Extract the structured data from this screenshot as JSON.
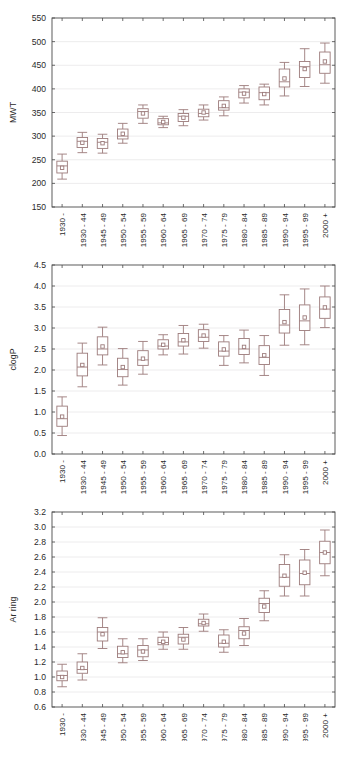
{
  "figure": {
    "width": 347,
    "height": 757,
    "background": "#ffffff",
    "box_color": "#9c7b7b",
    "axis_color": "#4a4a4a",
    "grid_color": "#e9e7e8",
    "xlabel": "Publication Year Bin",
    "categories": [
      "1930 -",
      "1930 - 44",
      "1945 - 49",
      "1950 - 54",
      "1955 - 59",
      "1960 - 64",
      "1965 - 69",
      "1970 - 74",
      "1975 - 79",
      "1980 - 84",
      "1985 - 89",
      "1990 - 94",
      "1995 - 99",
      "2000 +"
    ]
  },
  "chart_data": [
    {
      "type": "box",
      "id": "mwt",
      "title": "",
      "xlabel": "",
      "ylabel": "MWT",
      "ylim": [
        150,
        550
      ],
      "yticks": [
        150,
        200,
        250,
        300,
        350,
        400,
        450,
        500,
        550
      ],
      "ytick_labels": [
        "150",
        "200",
        "250",
        "300",
        "350",
        "400",
        "450",
        "500",
        "550"
      ],
      "grid": true,
      "legend": "none",
      "categories": [
        "1930 -",
        "1930 - 44",
        "1945 - 49",
        "1950 - 54",
        "1955 - 59",
        "1960 - 64",
        "1965 - 69",
        "1970 - 74",
        "1975 - 79",
        "1980 - 84",
        "1985 - 89",
        "1990 - 94",
        "1995 - 99",
        "2000 +"
      ],
      "boxes": [
        {
          "category": "1930 -",
          "whisker_low": 209,
          "q1": 222,
          "median": 237,
          "mean": 233,
          "q3": 247,
          "whisker_high": 262
        },
        {
          "category": "1930 - 44",
          "whisker_low": 265,
          "q1": 276,
          "median": 289,
          "mean": 286,
          "q3": 297,
          "whisker_high": 308
        },
        {
          "category": "1945 - 49",
          "whisker_low": 264,
          "q1": 274,
          "median": 287,
          "mean": 285,
          "q3": 295,
          "whisker_high": 304
        },
        {
          "category": "1950 - 54",
          "whisker_low": 285,
          "q1": 294,
          "median": 300,
          "mean": 305,
          "q3": 315,
          "whisker_high": 327
        },
        {
          "category": "1955 - 59",
          "whisker_low": 327,
          "q1": 338,
          "median": 352,
          "mean": 348,
          "q3": 358,
          "whisker_high": 366
        },
        {
          "category": "1960 - 64",
          "whisker_low": 318,
          "q1": 324,
          "median": 328,
          "mean": 330,
          "q3": 337,
          "whisker_high": 342
        },
        {
          "category": "1965 - 69",
          "whisker_low": 322,
          "q1": 331,
          "median": 342,
          "mean": 339,
          "q3": 348,
          "whisker_high": 356
        },
        {
          "category": "1970 - 74",
          "whisker_low": 334,
          "q1": 341,
          "median": 348,
          "mean": 350,
          "q3": 357,
          "whisker_high": 366
        },
        {
          "category": "1975 - 79",
          "whisker_low": 343,
          "q1": 355,
          "median": 360,
          "mean": 364,
          "q3": 375,
          "whisker_high": 383
        },
        {
          "category": "1980 - 84",
          "whisker_low": 370,
          "q1": 381,
          "median": 393,
          "mean": 390,
          "q3": 400,
          "whisker_high": 407
        },
        {
          "category": "1985 - 89",
          "whisker_low": 366,
          "q1": 377,
          "median": 392,
          "mean": 389,
          "q3": 404,
          "whisker_high": 410
        },
        {
          "category": "1990 - 94",
          "whisker_low": 385,
          "q1": 404,
          "median": 415,
          "mean": 422,
          "q3": 442,
          "whisker_high": 456
        },
        {
          "category": "1995 - 99",
          "whisker_low": 405,
          "q1": 424,
          "median": 447,
          "mean": 442,
          "q3": 458,
          "whisker_high": 485
        },
        {
          "category": "2000 +",
          "whisker_low": 412,
          "q1": 433,
          "median": 451,
          "mean": 458,
          "q3": 478,
          "whisker_high": 497
        }
      ]
    },
    {
      "type": "box",
      "id": "clogp",
      "title": "",
      "xlabel": "",
      "ylabel": "clogP",
      "ylim": [
        0.0,
        4.5
      ],
      "yticks": [
        0.0,
        0.5,
        1.0,
        1.5,
        2.0,
        2.5,
        3.0,
        3.5,
        4.0,
        4.5
      ],
      "ytick_labels": [
        "0.0",
        "0.5",
        "1.0",
        "1.5",
        "2.0",
        "2.5",
        "3.0",
        "3.5",
        "4.0",
        "4.5"
      ],
      "grid": true,
      "legend": "none",
      "categories": [
        "1930 -",
        "1930 - 44",
        "1945 - 49",
        "1950 - 54",
        "1955 - 59",
        "1960 - 64",
        "1965 - 69",
        "1970 - 74",
        "1975 - 79",
        "1980 - 84",
        "1985 - 89",
        "1990 - 94",
        "1995 - 99",
        "2000 +"
      ],
      "boxes": [
        {
          "category": "1930 -",
          "whisker_low": 0.44,
          "q1": 0.66,
          "median": 0.84,
          "mean": 0.89,
          "q3": 1.14,
          "whisker_high": 1.36
        },
        {
          "category": "1930 - 44",
          "whisker_low": 1.6,
          "q1": 1.86,
          "median": 2.07,
          "mean": 2.12,
          "q3": 2.4,
          "whisker_high": 2.64
        },
        {
          "category": "1945 - 49",
          "whisker_low": 2.12,
          "q1": 2.36,
          "median": 2.5,
          "mean": 2.56,
          "q3": 2.79,
          "whisker_high": 3.02
        },
        {
          "category": "1950 - 54",
          "whisker_low": 1.64,
          "q1": 1.84,
          "median": 2.01,
          "mean": 2.07,
          "q3": 2.28,
          "whisker_high": 2.51
        },
        {
          "category": "1955 - 59",
          "whisker_low": 1.9,
          "q1": 2.11,
          "median": 2.24,
          "mean": 2.27,
          "q3": 2.46,
          "whisker_high": 2.68
        },
        {
          "category": "1960 - 64",
          "whisker_low": 2.36,
          "q1": 2.5,
          "median": 2.57,
          "mean": 2.6,
          "q3": 2.72,
          "whisker_high": 2.84
        },
        {
          "category": "1965 - 69",
          "whisker_low": 2.38,
          "q1": 2.57,
          "median": 2.67,
          "mean": 2.71,
          "q3": 2.87,
          "whisker_high": 3.06
        },
        {
          "category": "1970 - 74",
          "whisker_low": 2.52,
          "q1": 2.68,
          "median": 2.78,
          "mean": 2.82,
          "q3": 2.96,
          "whisker_high": 3.09
        },
        {
          "category": "1975 - 79",
          "whisker_low": 2.11,
          "q1": 2.33,
          "median": 2.45,
          "mean": 2.49,
          "q3": 2.67,
          "whisker_high": 2.82
        },
        {
          "category": "1980 - 84",
          "whisker_low": 2.17,
          "q1": 2.37,
          "median": 2.5,
          "mean": 2.55,
          "q3": 2.75,
          "whisker_high": 2.95
        },
        {
          "category": "1985 - 89",
          "whisker_low": 1.87,
          "q1": 2.13,
          "median": 2.3,
          "mean": 2.35,
          "q3": 2.58,
          "whisker_high": 2.82
        },
        {
          "category": "1990 - 94",
          "whisker_low": 2.59,
          "q1": 2.88,
          "median": 3.07,
          "mean": 3.14,
          "q3": 3.44,
          "whisker_high": 3.79
        },
        {
          "category": "1995 - 99",
          "whisker_low": 2.6,
          "q1": 2.94,
          "median": 3.17,
          "mean": 3.25,
          "q3": 3.55,
          "whisker_high": 3.93
        },
        {
          "category": "2000 +",
          "whisker_low": 3.01,
          "q1": 3.23,
          "median": 3.45,
          "mean": 3.49,
          "q3": 3.74,
          "whisker_high": 4.0
        }
      ]
    },
    {
      "type": "box",
      "id": "arring",
      "title": "",
      "xlabel": "Publication Year Bin",
      "ylabel": "Ar ring",
      "ylim": [
        0.6,
        3.2
      ],
      "yticks": [
        0.6,
        0.8,
        1.0,
        1.2,
        1.4,
        1.6,
        1.8,
        2.0,
        2.2,
        2.4,
        2.6,
        2.8,
        3.0,
        3.2
      ],
      "ytick_labels": [
        "0.6",
        "0.8",
        "1.0",
        "1.2",
        "1.4",
        "1.6",
        "1.8",
        "2.0",
        "2.2",
        "2.4",
        "2.6",
        "2.8",
        "3.0",
        "3.2"
      ],
      "grid": true,
      "legend": "none",
      "categories": [
        "1930 -",
        "1930 - 44",
        "1945 - 49",
        "1950 - 54",
        "1955 - 59",
        "1960 - 64",
        "1965 - 69",
        "1970 - 74",
        "1975 - 79",
        "1980 - 84",
        "1985 - 89",
        "1990 - 94",
        "1995 - 99",
        "2000 +"
      ],
      "boxes": [
        {
          "category": "1930 -",
          "whisker_low": 0.87,
          "q1": 0.95,
          "median": 1.02,
          "mean": 1.0,
          "q3": 1.08,
          "whisker_high": 1.17
        },
        {
          "category": "1930 - 44",
          "whisker_low": 0.96,
          "q1": 1.05,
          "median": 1.1,
          "mean": 1.12,
          "q3": 1.2,
          "whisker_high": 1.31
        },
        {
          "category": "1945 - 49",
          "whisker_low": 1.38,
          "q1": 1.48,
          "median": 1.6,
          "mean": 1.57,
          "q3": 1.66,
          "whisker_high": 1.79
        },
        {
          "category": "1950 - 54",
          "whisker_low": 1.19,
          "q1": 1.26,
          "median": 1.31,
          "mean": 1.33,
          "q3": 1.41,
          "whisker_high": 1.51
        },
        {
          "category": "1955 - 59",
          "whisker_low": 1.22,
          "q1": 1.27,
          "median": 1.36,
          "mean": 1.34,
          "q3": 1.42,
          "whisker_high": 1.51
        },
        {
          "category": "1960 - 64",
          "whisker_low": 1.37,
          "q1": 1.43,
          "median": 1.46,
          "mean": 1.47,
          "q3": 1.53,
          "whisker_high": 1.6
        },
        {
          "category": "1965 - 69",
          "whisker_low": 1.37,
          "q1": 1.44,
          "median": 1.53,
          "mean": 1.5,
          "q3": 1.57,
          "whisker_high": 1.66
        },
        {
          "category": "1970 - 74",
          "whisker_low": 1.61,
          "q1": 1.68,
          "median": 1.71,
          "mean": 1.72,
          "q3": 1.77,
          "whisker_high": 1.84
        },
        {
          "category": "1975 - 79",
          "whisker_low": 1.33,
          "q1": 1.4,
          "median": 1.45,
          "mean": 1.47,
          "q3": 1.56,
          "whisker_high": 1.63
        },
        {
          "category": "1980 - 84",
          "whisker_low": 1.42,
          "q1": 1.51,
          "median": 1.62,
          "mean": 1.58,
          "q3": 1.67,
          "whisker_high": 1.78
        },
        {
          "category": "1985 - 89",
          "whisker_low": 1.75,
          "q1": 1.86,
          "median": 1.98,
          "mean": 1.94,
          "q3": 2.05,
          "whisker_high": 2.15
        },
        {
          "category": "1990 - 94",
          "whisker_low": 2.08,
          "q1": 2.21,
          "median": 2.33,
          "mean": 2.35,
          "q3": 2.5,
          "whisker_high": 2.63
        },
        {
          "category": "1995 - 99",
          "whisker_low": 2.08,
          "q1": 2.23,
          "median": 2.38,
          "mean": 2.39,
          "q3": 2.56,
          "whisker_high": 2.7
        },
        {
          "category": "2000 +",
          "whisker_low": 2.35,
          "q1": 2.51,
          "median": 2.66,
          "mean": 2.66,
          "q3": 2.81,
          "whisker_high": 2.96
        }
      ]
    }
  ]
}
